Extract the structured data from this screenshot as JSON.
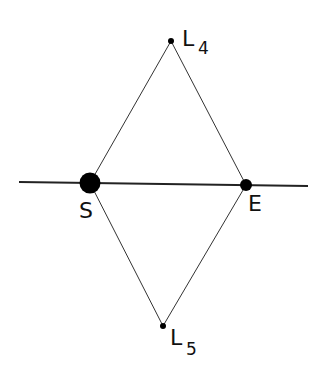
{
  "diagram": {
    "title": "",
    "line_color": "#222222",
    "bodies": [
      {
        "id": "S",
        "label": "S",
        "cx": 90,
        "cy": 183,
        "r": 10
      },
      {
        "id": "E",
        "label": "E",
        "cx": 246,
        "cy": 185,
        "r": 6
      }
    ],
    "points": [
      {
        "id": "L4",
        "label": "L",
        "subscript": "4",
        "cx": 171,
        "cy": 41,
        "r": 3
      },
      {
        "id": "L5",
        "label": "L",
        "subscript": "5",
        "cx": 163,
        "cy": 326,
        "r": 3
      }
    ],
    "baseline": {
      "x1": 19,
      "y1": 182,
      "x2": 308,
      "y2": 186
    },
    "edges": [
      [
        "S",
        "L4"
      ],
      [
        "L4",
        "E"
      ],
      [
        "S",
        "L5"
      ],
      [
        "L5",
        "E"
      ]
    ]
  }
}
